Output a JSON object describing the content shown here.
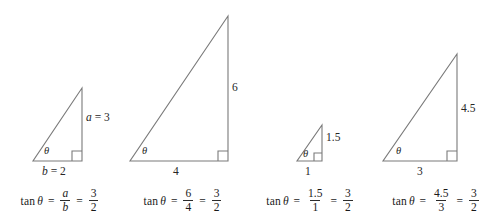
{
  "figure": {
    "stroke_color": "#7a7a7a",
    "text_color": "#262626",
    "background": "#ffffff",
    "theta_glyph": "θ"
  },
  "triangles": [
    {
      "id": "triangle-1",
      "theta_label": "θ",
      "opposite_label": "a = 3",
      "opposite_var": "a",
      "opposite_value": "3",
      "adjacent_label": "b = 2",
      "adjacent_var": "b",
      "adjacent_value": "2",
      "equation": {
        "function": "tan",
        "angle": "θ",
        "equals_1": "=",
        "ratio_numerator": "a",
        "ratio_denominator": "b",
        "ratio_italic": true,
        "equals_2": "=",
        "result_numerator": "3",
        "result_denominator": "2"
      },
      "geometry": {
        "base": 2,
        "height": 3
      }
    },
    {
      "id": "triangle-2",
      "theta_label": "θ",
      "opposite_label": "6",
      "adjacent_label": "4",
      "equation": {
        "function": "tan",
        "angle": "θ",
        "equals_1": "=",
        "ratio_numerator": "6",
        "ratio_denominator": "4",
        "ratio_italic": false,
        "equals_2": "=",
        "result_numerator": "3",
        "result_denominator": "2"
      },
      "geometry": {
        "base": 4,
        "height": 6
      }
    },
    {
      "id": "triangle-3",
      "theta_label": "θ",
      "opposite_label": "1.5",
      "adjacent_label": "1",
      "equation": {
        "function": "tan",
        "angle": "θ",
        "equals_1": "=",
        "ratio_numerator": "1.5",
        "ratio_denominator": "1",
        "ratio_italic": false,
        "equals_2": "=",
        "result_numerator": "3",
        "result_denominator": "2"
      },
      "geometry": {
        "base": 1,
        "height": 1.5
      }
    },
    {
      "id": "triangle-4",
      "theta_label": "θ",
      "opposite_label": "4.5",
      "adjacent_label": "3",
      "equation": {
        "function": "tan",
        "angle": "θ",
        "equals_1": "=",
        "ratio_numerator": "4.5",
        "ratio_denominator": "3",
        "ratio_italic": false,
        "equals_2": "=",
        "result_numerator": "3",
        "result_denominator": "2"
      },
      "geometry": {
        "base": 3,
        "height": 4.5
      }
    }
  ]
}
